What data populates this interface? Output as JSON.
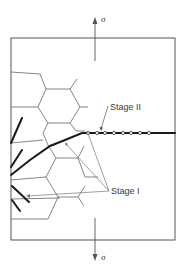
{
  "diagram": {
    "labels": {
      "stress_top": "σ",
      "stress_bottom": "σ",
      "stage_two": "Stage II",
      "stage_one": "Stage I"
    },
    "colors": {
      "line": "#555555",
      "crack": "#1a1a1a",
      "text": "#3a3a3a"
    }
  }
}
